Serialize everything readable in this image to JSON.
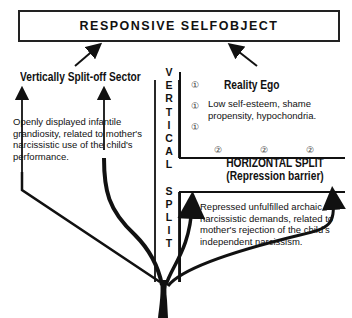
{
  "title": "RESPONSIVE SELFOBJECT",
  "left_sector": {
    "heading": "Vertically Split-off Sector",
    "description_lines": [
      "Openly displayed infantile",
      "grandiosity, related to mother's",
      "narcissistic use of the child's",
      "performance."
    ]
  },
  "right_sector": {
    "heading": "Reality Ego",
    "description_lines": [
      "Low self-esteem, shame",
      "propensity, hypochondria."
    ],
    "markers_vertical": [
      "①",
      "①",
      "①"
    ],
    "markers_horizontal": [
      "②",
      "②",
      "②"
    ]
  },
  "vertical_split_letters": [
    "V",
    "E",
    "R",
    "T",
    "I",
    "C",
    "A",
    "L",
    "",
    "S",
    "P",
    "L",
    "I",
    "T"
  ],
  "horizontal_split": {
    "line1": "HORIZONTAL SPLIT",
    "line2": "(Repression barrier)"
  },
  "repressed": {
    "description_lines": [
      "Repressed unfulfilled archaic",
      "narcissistic demands, related to",
      "mother's rejection of the child's",
      "independent narcissism."
    ]
  },
  "colors": {
    "ink": "#111111",
    "background": "#ffffff"
  }
}
